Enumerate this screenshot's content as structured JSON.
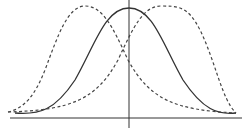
{
  "diagram": {
    "type": "distribution-curves",
    "background": "#ffffff",
    "stroke_color": "#333333",
    "axes": {
      "x_axis": {
        "x1": 10,
        "y1": 118,
        "x2": 242,
        "y2": 118
      },
      "y_axis": {
        "x1": 129,
        "y1": 0,
        "x2": 129,
        "y2": 128
      }
    },
    "curves": [
      {
        "name": "symmetric-solid-curve",
        "style": "solid",
        "path": "M 15 113 C 40 115, 55 110, 75 80 C 95 45, 105 8, 129 8 C 153 8, 163 45, 183 80 C 203 110, 218 115, 236 113"
      },
      {
        "name": "left-skewed-dashed-curve",
        "style": "dashed",
        "path": "M 8 112 C 25 108, 35 95, 45 70 C 58 35, 68 6, 85 6 C 102 6, 112 25, 128 60 C 150 100, 175 110, 236 113"
      },
      {
        "name": "right-skewed-dashed-curve",
        "style": "dashed",
        "path": "M 8 112 C 71 110, 96 100, 118 60 C 134 25, 144 6, 161 6 C 178 6, 188 6, 200 30 C 215 60, 222 100, 236 113"
      }
    ]
  }
}
